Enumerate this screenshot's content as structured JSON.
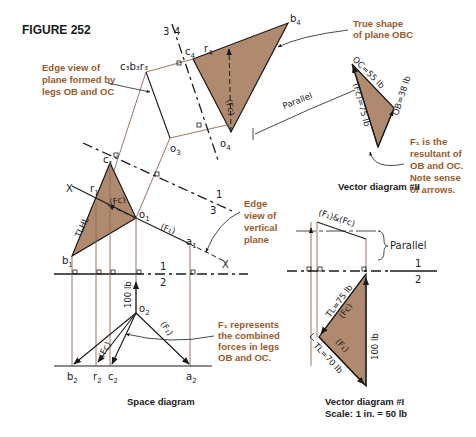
{
  "figure": {
    "title": "FIGURE 252"
  },
  "colors": {
    "plane_fill": "#b08a6e",
    "note_text": "#9a5a2a",
    "ink": "#1a1a1a",
    "projector": "#8a6a55"
  },
  "notes": {
    "edge_view_obc": [
      "Edge view of",
      "plane formed by",
      "legs OB and OC"
    ],
    "true_shape": [
      "True shape",
      "of plane OBC"
    ],
    "resultant": [
      "F₁ is the",
      "resultant of",
      "OB and OC.",
      "Note sense",
      "of arrows."
    ],
    "edge_view_vertical": [
      "Edge",
      "view of",
      "vertical",
      "plane"
    ],
    "fc_represents": [
      "F₁ represents",
      "the combined",
      "forces in legs",
      "OB and OC."
    ]
  },
  "fold_lines": {
    "l34_top": "3",
    "l34_bottom": "4",
    "l13_top": "1",
    "l13_bottom": "3",
    "l12_top": "1",
    "l12_bottom": "2",
    "v12_top": "1",
    "v12_bottom": "2"
  },
  "points": {
    "b4": "b",
    "b4_sub": "4",
    "r4": "r",
    "r4_sub": "4",
    "c4": "c",
    "c4_sub": "4",
    "o4": "o",
    "o4_sub": "4",
    "c3b3r3": "c₃b₃r₃",
    "o3": "o",
    "o3_sub": "3",
    "c1": "c",
    "c1_sub": "1",
    "r1": "r",
    "r1_sub": "1",
    "o1": "o",
    "o1_sub": "1",
    "a1": "a",
    "a1_sub": "1",
    "b1": "b",
    "b1_sub": "1",
    "o2": "o",
    "o2_sub": "2",
    "b2": "b",
    "b2_sub": "2",
    "r2": "r",
    "r2_sub": "2",
    "c2": "c",
    "c2_sub": "2",
    "a2": "a",
    "a2_sub": "2",
    "x_left": "X",
    "x_right": "X"
  },
  "labels": {
    "fc": "(Fc)",
    "f1": "(F₁)",
    "tlhl": "TLHL",
    "parallel_top": "Parallel",
    "parallel_right": "Parallel",
    "load": "100 lb",
    "oc": "OC=55 lb",
    "ob": "OB=38 lb",
    "fc_75": "(Fc)=75 lb",
    "f1_and_fc": "(F₁)&(Fc)",
    "tl75": "TL=75 lb",
    "tl70": "TL=70 lb",
    "fc_v1": "(Fc)",
    "f1_v1": "(F₁)",
    "load_v1": "100 lb"
  },
  "captions": {
    "space": "Space diagram",
    "vector2": "Vector diagram #II",
    "vector1": "Vector diagram #I",
    "scale": "Scale: 1 in. = 50 lb"
  }
}
